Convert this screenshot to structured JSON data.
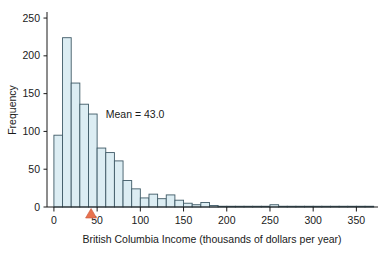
{
  "chart_data": {
    "type": "bar",
    "title": "",
    "subtitle": "",
    "xlabel": "British Columbia Income (thousands of dollars per year)",
    "ylabel": "Frequency",
    "xlim": [
      -8,
      375
    ],
    "ylim": [
      0,
      258
    ],
    "grid": false,
    "legend": null,
    "bin_width": 10,
    "bin_starts": [
      0,
      10,
      20,
      30,
      40,
      50,
      60,
      70,
      80,
      90,
      100,
      110,
      120,
      130,
      140,
      150,
      160,
      170,
      180,
      190,
      200,
      210,
      220,
      230,
      240,
      250,
      260,
      270,
      280,
      290,
      300,
      310,
      320,
      330,
      340,
      350,
      360
    ],
    "values": [
      95,
      224,
      164,
      136,
      123,
      78,
      72,
      61,
      35,
      24,
      12,
      17,
      11,
      16,
      9,
      5,
      3,
      6,
      2,
      1,
      1,
      1,
      1,
      1,
      1,
      3,
      1,
      1,
      1,
      1,
      1,
      1,
      1,
      1,
      1,
      1,
      1
    ],
    "xticks": [
      0,
      50,
      100,
      150,
      200,
      250,
      300,
      350
    ],
    "xticklabels": [
      "0",
      "50",
      "100",
      "150",
      "200",
      "250",
      "300",
      "350"
    ],
    "yticks": [
      0,
      50,
      100,
      150,
      200,
      250
    ],
    "yticklabels": [
      "0",
      "50",
      "100",
      "150",
      "200",
      "250"
    ],
    "annotations": [
      {
        "name": "mean-label",
        "text": "Mean = 43.0",
        "x": 60,
        "y": 118
      }
    ],
    "markers": [
      {
        "name": "mean-triangle-marker",
        "shape": "triangle-up",
        "x": 43,
        "y": 0,
        "color": "#e8724e"
      }
    ],
    "style": {
      "bar_fill": "#dcedf3",
      "bar_edge": "#3f5a66",
      "axis_color": "#1a1a1a",
      "marker_color": "#e8724e",
      "background": "#ffffff"
    }
  }
}
